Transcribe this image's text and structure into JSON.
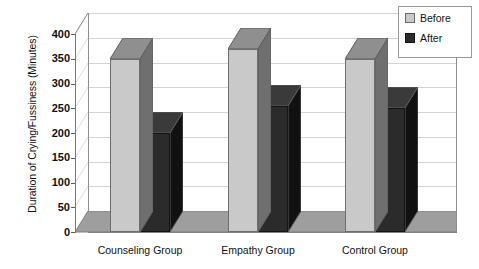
{
  "chart_data": {
    "type": "bar",
    "title": "",
    "xlabel": "",
    "ylabel": "Duration of Crying/Fussiness (Minutes)",
    "categories": [
      "Counseling Group",
      "Empathy Group",
      "Control Group"
    ],
    "series": [
      {
        "name": "Before",
        "values": [
          350,
          370,
          350
        ],
        "color": "#c9c9c9"
      },
      {
        "name": "After",
        "values": [
          200,
          255,
          250
        ],
        "color": "#2b2b2b"
      }
    ],
    "ylim": [
      0,
      400
    ],
    "ytick_values": [
      0,
      50,
      100,
      150,
      200,
      250,
      300,
      350,
      400
    ],
    "ytick_labels": [
      "0",
      "50",
      "100",
      "150",
      "200",
      "250",
      "300",
      "350",
      "400"
    ],
    "grid": true,
    "grid_axis": "y",
    "legend_position": "top-right",
    "three_d": true,
    "style": {
      "plot_background": "#ffffff",
      "floor_color": "#9e9e9e",
      "frame_color": "#8d8d8d",
      "gridline_color": "#d3d3d3",
      "text_color": "#111111"
    }
  },
  "legend": {
    "items": [
      {
        "label": "Before"
      },
      {
        "label": "After"
      }
    ]
  },
  "axis": {
    "y_title": "Duration of Crying/Fussiness (Minutes)"
  }
}
